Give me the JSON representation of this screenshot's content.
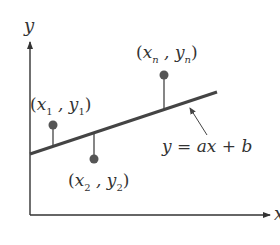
{
  "diagram": {
    "colors": {
      "axis": "#333333",
      "line": "#444444",
      "point": "#555555",
      "text": "#333333"
    },
    "axes": {
      "x_label": "x",
      "y_label": "y"
    },
    "line": {
      "equation": "y = ax + b"
    },
    "points": [
      {
        "id": "1",
        "label_open": "(",
        "var_x": "x",
        "sub_x": "1",
        "comma": " , ",
        "var_y": "y",
        "sub_y": "1",
        "label_close": ")"
      },
      {
        "id": "2",
        "label_open": "(",
        "var_x": "x",
        "sub_x": "2",
        "comma": " , ",
        "var_y": "y",
        "sub_y": "2",
        "label_close": ")"
      },
      {
        "id": "n",
        "label_open": "(",
        "var_x": "x",
        "sub_x": "n",
        "comma": " , ",
        "var_y": "y",
        "sub_y": "n",
        "label_close": ")"
      }
    ]
  }
}
